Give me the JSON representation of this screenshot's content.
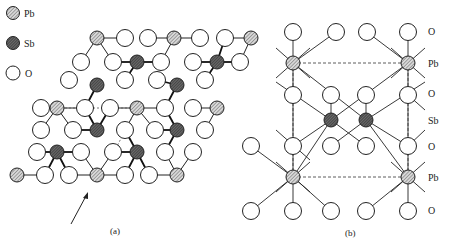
{
  "legend": {
    "items": [
      {
        "symbol": "Pb",
        "label": "Pb",
        "fill": "hatched-light"
      },
      {
        "symbol": "Sb",
        "label": "Sb",
        "fill": "hatched-dark"
      },
      {
        "symbol": "O",
        "label": "O",
        "fill": "white"
      }
    ]
  },
  "panel_a": {
    "caption": "(a)",
    "description": "Plan view of layered PbSb2O6-type structure; arrow indicates viewing direction for (b)",
    "pb_atoms": [
      [
        97,
        38
      ],
      [
        174,
        38
      ],
      [
        251,
        38
      ],
      [
        57,
        108
      ],
      [
        137,
        108
      ],
      [
        217,
        108
      ],
      [
        17,
        175
      ],
      [
        97,
        175
      ],
      [
        177,
        175
      ]
    ],
    "sb_atoms": [
      [
        137,
        62
      ],
      [
        217,
        62
      ],
      [
        97,
        85
      ],
      [
        177,
        85
      ],
      [
        97,
        130
      ],
      [
        177,
        130
      ],
      [
        57,
        152
      ],
      [
        137,
        152
      ]
    ],
    "o_atoms": [
      [
        125,
        38
      ],
      [
        148,
        38
      ],
      [
        200,
        38
      ],
      [
        225,
        38
      ],
      [
        81,
        62
      ],
      [
        113,
        62
      ],
      [
        161,
        62
      ],
      [
        193,
        62
      ],
      [
        240,
        62
      ],
      [
        69,
        80
      ],
      [
        125,
        80
      ],
      [
        157,
        80
      ],
      [
        205,
        80
      ],
      [
        41,
        108
      ],
      [
        85,
        108
      ],
      [
        110,
        108
      ],
      [
        165,
        108
      ],
      [
        193,
        108
      ],
      [
        41,
        130
      ],
      [
        73,
        130
      ],
      [
        125,
        130
      ],
      [
        155,
        130
      ],
      [
        205,
        130
      ],
      [
        37,
        152
      ],
      [
        81,
        152
      ],
      [
        113,
        152
      ],
      [
        165,
        152
      ],
      [
        193,
        152
      ],
      [
        45,
        175
      ],
      [
        69,
        175
      ],
      [
        125,
        175
      ],
      [
        149,
        175
      ]
    ]
  },
  "panel_b": {
    "caption": "(b)",
    "layer_labels": [
      "O",
      "Pb",
      "O",
      "Sb",
      "O",
      "Pb",
      "O"
    ],
    "pb_atoms": [
      [
        293,
        63
      ],
      [
        408,
        63
      ],
      [
        293,
        177
      ],
      [
        408,
        177
      ]
    ],
    "sb_atoms": [
      [
        331,
        120
      ],
      [
        366,
        120
      ]
    ],
    "o_atoms": [
      [
        293,
        32
      ],
      [
        336,
        32
      ],
      [
        367,
        32
      ],
      [
        408,
        32
      ],
      [
        293,
        95
      ],
      [
        331,
        95
      ],
      [
        366,
        95
      ],
      [
        408,
        95
      ],
      [
        293,
        146
      ],
      [
        331,
        146
      ],
      [
        366,
        146
      ],
      [
        408,
        146
      ],
      [
        251,
        146
      ],
      [
        251,
        211
      ],
      [
        293,
        211
      ],
      [
        331,
        211
      ],
      [
        366,
        211
      ],
      [
        408,
        211
      ]
    ]
  }
}
